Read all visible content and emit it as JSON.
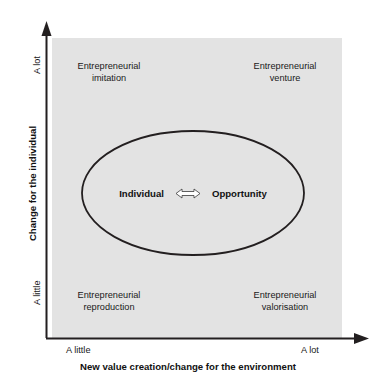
{
  "figure": {
    "type": "2x2-matrix-diagram",
    "plot_background_color": "#e3e3e3",
    "axis_color": "#231f20"
  },
  "axes": {
    "y": {
      "title": "Change for the individual",
      "tick_high": "A lot",
      "tick_low": "A little"
    },
    "x": {
      "title": "New value creation/change for the environment",
      "tick_low": "A little",
      "tick_high": "A lot"
    }
  },
  "quadrants": [
    {
      "id": "top-left",
      "line1": "Entrepreneurial",
      "line2": "imitation"
    },
    {
      "id": "top-right",
      "line1": "Entrepreneurial",
      "line2": "venture"
    },
    {
      "id": "bottom-left",
      "line1": "Entrepreneurial",
      "line2": "reproduction"
    },
    {
      "id": "bottom-right",
      "line1": "Entrepreneurial",
      "line2": "valorisation"
    }
  ],
  "ellipse": {
    "left_node": "Individual",
    "right_node": "Opportunity",
    "relation_icon": "double-headed-arrow-icon"
  }
}
